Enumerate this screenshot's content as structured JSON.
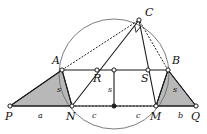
{
  "figure": {
    "background_color": "#ffffff",
    "stroke_color": "#1a1a1a",
    "shade_fill": "#b8b8b8",
    "shade_stroke": "#1a1a1a",
    "circle_color": "#6e6e6e",
    "dotted_color": "#222222"
  },
  "points": [
    {
      "id": "P",
      "label": "P",
      "x": 10,
      "y": 106,
      "label_x": 5,
      "label_y": 120
    },
    {
      "id": "N",
      "label": "N",
      "x": 72,
      "y": 106,
      "label_x": 66,
      "label_y": 120
    },
    {
      "id": "O",
      "label": "",
      "x": 114,
      "y": 106,
      "label_x": 114,
      "label_y": 106
    },
    {
      "id": "M",
      "label": "M",
      "x": 156,
      "y": 106,
      "label_x": 150,
      "label_y": 120
    },
    {
      "id": "Q",
      "label": "Q",
      "x": 196,
      "y": 106,
      "label_x": 191,
      "label_y": 120
    },
    {
      "id": "A",
      "label": "A",
      "x": 62,
      "y": 70,
      "label_x": 52,
      "label_y": 64
    },
    {
      "id": "R",
      "label": "R",
      "x": 97,
      "y": 70,
      "label_x": 93,
      "label_y": 82
    },
    {
      "id": "T",
      "label": "",
      "x": 114,
      "y": 70,
      "label_x": 114,
      "label_y": 70
    },
    {
      "id": "S",
      "label": "S",
      "x": 148,
      "y": 70,
      "label_x": 141,
      "label_y": 82
    },
    {
      "id": "B",
      "label": "B",
      "x": 168,
      "y": 70,
      "label_x": 172,
      "label_y": 64
    },
    {
      "id": "C",
      "label": "C",
      "x": 139,
      "y": 20,
      "label_x": 145,
      "label_y": 16
    }
  ],
  "circle": {
    "cx": 114,
    "cy": 74,
    "r": 55
  },
  "segments": [
    {
      "name": "baseline-P-Q",
      "from": "P",
      "to": "Q",
      "style": "solid"
    },
    {
      "name": "side-P-A",
      "from": "P",
      "to": "A",
      "style": "solid"
    },
    {
      "name": "side-A-N",
      "from": "A",
      "to": "N",
      "style": "solid"
    },
    {
      "name": "top-A-B",
      "from": "A",
      "to": "B",
      "style": "solid"
    },
    {
      "name": "side-B-M",
      "from": "B",
      "to": "M",
      "style": "solid"
    },
    {
      "name": "side-B-Q",
      "from": "B",
      "to": "Q",
      "style": "solid"
    },
    {
      "name": "mid-vertical",
      "from": "T",
      "to": "O",
      "style": "solid"
    },
    {
      "name": "chord-N-C",
      "from": "N",
      "to": "C",
      "style": "solid"
    },
    {
      "name": "chord-M-C",
      "from": "M",
      "to": "C",
      "style": "solid"
    },
    {
      "name": "chord-A-C",
      "from": "A",
      "to": "C",
      "style": "dotted"
    },
    {
      "name": "chord-B-C",
      "from": "B",
      "to": "C",
      "style": "dotted"
    },
    {
      "name": "base-N-M-dotted",
      "from": "N",
      "to": "M",
      "style": "dotted-overlay"
    }
  ],
  "shaded_triangles": [
    {
      "name": "left-triangle-PAN",
      "vertices": [
        "P",
        "A",
        "N"
      ]
    },
    {
      "name": "right-triangle-MBQ",
      "vertices": [
        "M",
        "B",
        "Q"
      ]
    }
  ],
  "right_angle_marker": {
    "at": "C",
    "size": 7
  },
  "segment_labels": [
    {
      "name": "label-a",
      "text": "a",
      "x": 38,
      "y": 118
    },
    {
      "name": "label-c-left",
      "text": "c",
      "x": 92,
      "y": 118
    },
    {
      "name": "label-c-right",
      "text": "c",
      "x": 136,
      "y": 118
    },
    {
      "name": "label-b",
      "text": "b",
      "x": 178,
      "y": 118
    },
    {
      "name": "label-s-left",
      "text": "s",
      "x": 57,
      "y": 92
    },
    {
      "name": "label-s-middle",
      "text": "s",
      "x": 108,
      "y": 92
    },
    {
      "name": "label-s-right",
      "text": "s",
      "x": 173,
      "y": 92
    }
  ]
}
